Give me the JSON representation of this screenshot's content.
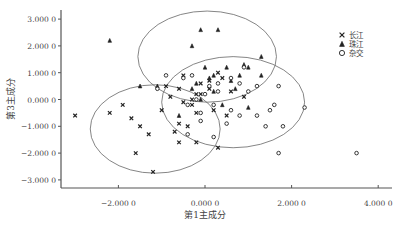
{
  "chart_data": {
    "type": "scatter",
    "title": "",
    "xlabel": "第1主成分",
    "ylabel": "第3主成分",
    "xlim": [
      -3.4,
      4.2
    ],
    "ylim": [
      -3.3,
      3.3
    ],
    "x_ticks": [
      {
        "value": -2,
        "label": "−2.000 0"
      },
      {
        "value": 0,
        "label": "0.000 0"
      },
      {
        "value": 2,
        "label": "2.000 0"
      },
      {
        "value": 4,
        "label": "4.000 0"
      }
    ],
    "y_ticks": [
      {
        "value": 3,
        "label": "3.000 0"
      },
      {
        "value": 2,
        "label": "2.000 0"
      },
      {
        "value": 1,
        "label": "1.000 0"
      },
      {
        "value": 0,
        "label": "0.000 0"
      },
      {
        "value": -1,
        "label": "−1.000 0"
      },
      {
        "value": -2,
        "label": "−2.000 0"
      },
      {
        "value": -3,
        "label": "−3.000 0"
      }
    ],
    "grid": false,
    "legend_position": "upper right",
    "series": [
      {
        "name": "长江",
        "marker": "x",
        "points": [
          [
            -3.0,
            -0.6
          ],
          [
            -2.2,
            -0.5
          ],
          [
            -1.7,
            -0.7
          ],
          [
            -1.3,
            -1.3
          ],
          [
            -1.6,
            -2.0
          ],
          [
            -1.2,
            -2.7
          ],
          [
            -0.7,
            -1.2
          ],
          [
            -0.6,
            -1.6
          ],
          [
            -0.6,
            -0.9
          ],
          [
            -0.5,
            -0.1
          ],
          [
            -0.3,
            0.0
          ],
          [
            -0.2,
            0.2
          ],
          [
            -0.4,
            -1.0
          ],
          [
            0.2,
            -0.4
          ],
          [
            -0.1,
            0.6
          ],
          [
            0.1,
            0.4
          ],
          [
            -0.9,
            0.5
          ],
          [
            -0.8,
            0.1
          ],
          [
            0.5,
            -0.6
          ],
          [
            -0.3,
            -0.2
          ],
          [
            0.3,
            1.0
          ],
          [
            0.1,
            0.7
          ],
          [
            -0.5,
            0.9
          ],
          [
            0.6,
            0.3
          ],
          [
            -1.5,
            -1.0
          ],
          [
            -0.2,
            -0.5
          ],
          [
            0.4,
            0.8
          ],
          [
            -0.1,
            0.2
          ],
          [
            0.9,
            0.1
          ],
          [
            -0.6,
            0.4
          ],
          [
            -0.2,
            -1.6
          ],
          [
            0.3,
            -1.8
          ],
          [
            -1.0,
            -0.4
          ],
          [
            -1.9,
            -0.2
          ]
        ]
      },
      {
        "name": "珠江",
        "marker": "triangle",
        "points": [
          [
            -2.2,
            2.2
          ],
          [
            -0.1,
            2.6
          ],
          [
            0.3,
            2.6
          ],
          [
            -0.3,
            2.0
          ],
          [
            -1.5,
            0.5
          ],
          [
            -1.1,
            0.5
          ],
          [
            0.0,
            1.2
          ],
          [
            0.2,
            0.9
          ],
          [
            0.5,
            1.2
          ],
          [
            -0.2,
            0.6
          ],
          [
            0.6,
            0.7
          ],
          [
            0.9,
            1.3
          ],
          [
            1.0,
            1.2
          ],
          [
            0.2,
            0.3
          ],
          [
            0.7,
            0.4
          ],
          [
            1.3,
            0.9
          ],
          [
            1.3,
            1.6
          ],
          [
            0.1,
            0.8
          ],
          [
            -0.1,
            0.0
          ],
          [
            0.4,
            -0.2
          ],
          [
            -0.6,
            -0.6
          ],
          [
            1.0,
            -0.3
          ],
          [
            -0.3,
            0.4
          ],
          [
            0.8,
            0.9
          ]
        ]
      },
      {
        "name": "杂交",
        "marker": "circle",
        "points": [
          [
            -0.9,
            0.9
          ],
          [
            -0.5,
            0.8
          ],
          [
            -0.3,
            0.9
          ],
          [
            0.3,
            0.6
          ],
          [
            0.6,
            0.8
          ],
          [
            0.8,
            0.6
          ],
          [
            1.0,
            0.3
          ],
          [
            1.2,
            0.5
          ],
          [
            0.3,
            0.3
          ],
          [
            0.0,
            0.2
          ],
          [
            -0.2,
            0.0
          ],
          [
            -0.4,
            -0.2
          ],
          [
            0.2,
            -0.2
          ],
          [
            0.6,
            -0.4
          ],
          [
            -0.1,
            -0.5
          ],
          [
            0.8,
            -0.6
          ],
          [
            1.2,
            -0.6
          ],
          [
            1.6,
            -0.2
          ],
          [
            1.5,
            -0.4
          ],
          [
            1.7,
            0.5
          ],
          [
            1.4,
            -1.0
          ],
          [
            1.8,
            -1.0
          ],
          [
            2.3,
            -0.3
          ],
          [
            1.7,
            -2.0
          ],
          [
            3.5,
            -2.0
          ],
          [
            0.2,
            -1.4
          ],
          [
            -0.4,
            -1.3
          ],
          [
            -0.1,
            -0.8
          ],
          [
            0.5,
            -0.9
          ],
          [
            0.9,
            1.2
          ],
          [
            -1.1,
            0.4
          ],
          [
            0.1,
            0.5
          ]
        ]
      }
    ],
    "ellipses": [
      {
        "group": "长江",
        "cx": -1.15,
        "cy": -1.1,
        "rx": 1.5,
        "ry": 1.65,
        "angle_deg": 0
      },
      {
        "group": "珠江",
        "cx": 0.05,
        "cy": 1.6,
        "rx": 1.6,
        "ry": 1.7,
        "angle_deg": 0
      },
      {
        "group": "杂交",
        "cx": 0.65,
        "cy": -0.1,
        "rx": 1.65,
        "ry": 1.7,
        "angle_deg": 0
      }
    ]
  },
  "legend": {
    "items": [
      {
        "label": "长江",
        "marker": "x"
      },
      {
        "label": "珠江",
        "marker": "triangle"
      },
      {
        "label": "杂交",
        "marker": "circle"
      }
    ]
  }
}
